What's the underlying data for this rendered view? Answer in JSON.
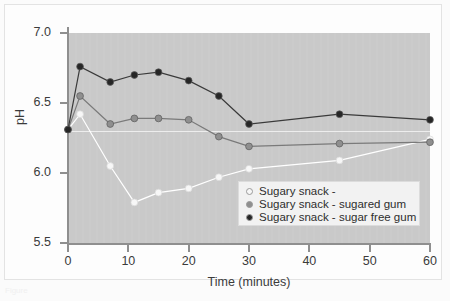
{
  "figure": {
    "caption_fragment": "Figure"
  },
  "legend": {
    "position": "inside-lower-right",
    "entries": [
      {
        "label": "Sugary snack -",
        "color": "#f7f7f7"
      },
      {
        "label": "Sugary snack - sugared gum",
        "color": "#8f8f8f"
      },
      {
        "label": "Sugary snack - sugar free gum",
        "color": "#262626"
      }
    ]
  },
  "chart_data": {
    "type": "line",
    "title": "",
    "xlabel": "Time (minutes)",
    "ylabel": "pH",
    "xlim": [
      0,
      60
    ],
    "ylim": [
      5.5,
      7.0
    ],
    "xticks": [
      0,
      10,
      20,
      30,
      40,
      50,
      60
    ],
    "yticks": [
      5.5,
      6.0,
      6.5,
      7.0
    ],
    "xtick_labels": [
      "0",
      "10",
      "20",
      "30",
      "40",
      "50",
      "60"
    ],
    "ytick_labels": [
      "5.5",
      "6.0",
      "6.5",
      "7.0"
    ],
    "grid": false,
    "plot_background": "#c9c9c9",
    "reference_line": {
      "value": 6.3,
      "label": "",
      "color": "#ededed"
    },
    "x": [
      0,
      2,
      7,
      11,
      15,
      20,
      25,
      30,
      45,
      60
    ],
    "series": [
      {
        "name": "Sugary snack -",
        "color": "#f7f7f7",
        "marker": "open-circle",
        "values": [
          6.31,
          6.42,
          6.05,
          5.79,
          5.86,
          5.89,
          5.97,
          6.03,
          6.09,
          6.24
        ]
      },
      {
        "name": "Sugary snack - sugared gum",
        "color": "#8f8f8f",
        "marker": "filled-circle",
        "values": [
          6.31,
          6.55,
          6.35,
          6.39,
          6.39,
          6.38,
          6.26,
          6.19,
          6.21,
          6.22
        ]
      },
      {
        "name": "Sugary snack - sugar free gum",
        "color": "#262626",
        "marker": "filled-circle",
        "values": [
          6.31,
          6.76,
          6.65,
          6.7,
          6.72,
          6.66,
          6.55,
          6.35,
          6.42,
          6.38
        ]
      }
    ]
  }
}
